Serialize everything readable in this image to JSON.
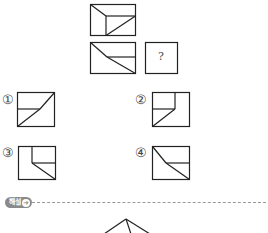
{
  "problem": {
    "figure_top": "top-view-box",
    "figure_middle": "middle-view-box",
    "unknown_label": "?"
  },
  "options": [
    {
      "number": "①"
    },
    {
      "number": "②"
    },
    {
      "number": "③"
    },
    {
      "number": "④"
    }
  ],
  "explanation": {
    "badge_label": "해설",
    "badge_icon": "circle-arrow-icon",
    "badge_icon_glyph": "➜"
  },
  "colors": {
    "line": "#222222",
    "badge_bg": "#8a8a8a"
  }
}
